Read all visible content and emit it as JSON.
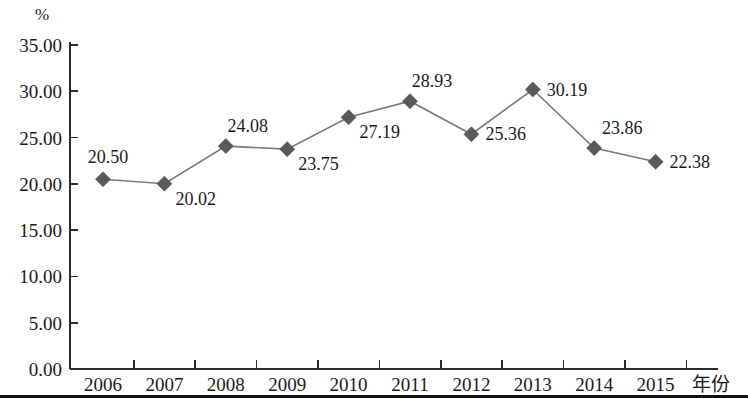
{
  "chart_data": {
    "type": "line",
    "title": "",
    "subtitle": "",
    "xlabel": "年份",
    "ylabel": "%",
    "unit_label": "%",
    "categories": [
      "2006",
      "2007",
      "2008",
      "2009",
      "2010",
      "2011",
      "2012",
      "2013",
      "2014",
      "2015"
    ],
    "values": [
      20.5,
      20.02,
      24.08,
      23.75,
      27.19,
      28.93,
      25.36,
      30.19,
      23.86,
      22.38
    ],
    "point_labels": [
      "20.50",
      "20.02",
      "24.08",
      "23.75",
      "27.19",
      "28.93",
      "25.36",
      "30.19",
      "23.86",
      "22.38"
    ],
    "label_positions": [
      "above-left",
      "below-right",
      "above",
      "below-right",
      "below-right",
      "above",
      "right",
      "right",
      "above-right",
      "right"
    ],
    "ylim": [
      0,
      35
    ],
    "ytick_values": [
      0,
      5,
      10,
      15,
      20,
      25,
      30,
      35
    ],
    "ytick_labels": [
      "0.00",
      "5.00",
      "10.00",
      "15.00",
      "20.00",
      "25.00",
      "30.00",
      "35.00"
    ],
    "grid": false,
    "legend": "none",
    "series_color": "#7a7a7a",
    "marker_color": "#595959",
    "marker_shape": "diamond",
    "axis_color": "#2b2b2b"
  }
}
